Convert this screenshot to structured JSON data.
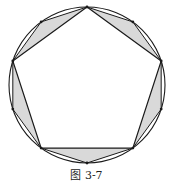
{
  "figure": {
    "caption": "图 3-7",
    "circle": {
      "cx": 87,
      "cy": 85,
      "r": 78
    },
    "pentagon_start_angle_deg": -90,
    "colors": {
      "stroke": "#1a1a1a",
      "shade": "#d9d9d9",
      "background": "#ffffff"
    }
  }
}
